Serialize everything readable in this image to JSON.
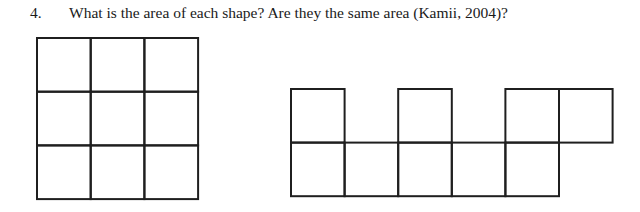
{
  "question": {
    "number": "4.",
    "text": "What is the area of each shape?  Are they the same area (Kamii, 2004)?"
  },
  "figures": {
    "line_color": "#1f1f1f",
    "square_grid": {
      "rows": 3,
      "cols": 3,
      "cell_count": 9
    },
    "irregular_shape": {
      "bottom_row_cells": [
        0,
        1,
        2,
        3,
        4
      ],
      "top_row_cells": [
        0,
        2,
        4,
        5
      ],
      "cell_count": 9
    }
  }
}
